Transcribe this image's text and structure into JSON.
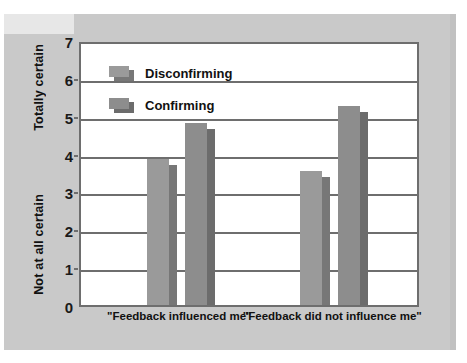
{
  "chart_data": {
    "type": "bar",
    "title": "",
    "xlabel": "",
    "ylabel": "",
    "ylim": [
      0,
      7
    ],
    "ytick_labels": [
      "0",
      "1",
      "2",
      "3",
      "4",
      "5",
      "6",
      "7"
    ],
    "ytick_values": [
      0,
      1,
      2,
      3,
      4,
      5,
      6,
      7
    ],
    "y_axis_top_annotation": "Totally certain",
    "y_axis_bottom_annotation": "Not at all certain",
    "grid": true,
    "legend_position": "top-left-inside",
    "categories": [
      "\"Feedback influenced me\"",
      "\"Feedback did not influence me\""
    ],
    "series": [
      {
        "name": "Disconfirming",
        "values": [
          3.85,
          3.55
        ],
        "color": "#9a9a9a"
      },
      {
        "name": "Confirming",
        "values": [
          4.8,
          5.25
        ],
        "color": "#8d8d8d"
      }
    ]
  },
  "axis": {
    "y_ticks": [
      {
        "label": "7",
        "value": 7
      },
      {
        "label": "6",
        "value": 6
      },
      {
        "label": "5",
        "value": 5
      },
      {
        "label": "4",
        "value": 4
      },
      {
        "label": "3",
        "value": 3
      },
      {
        "label": "2",
        "value": 2
      },
      {
        "label": "1",
        "value": 1
      },
      {
        "label": "0",
        "value": 0
      }
    ],
    "y_title_top": "Totally certain",
    "y_title_bottom": "Not at all certain",
    "x_labels": [
      "\"Feedback influenced me\"",
      "\"Feedback did not influence me\""
    ]
  },
  "legend": {
    "entries": [
      {
        "label": "Disconfirming",
        "swatch": "light-grey-3d-bar-icon"
      },
      {
        "label": "Confirming",
        "swatch": "dark-grey-3d-bar-icon"
      }
    ]
  },
  "colors": {
    "panel_background": "#c9c9c9",
    "plot_background": "#ffffff",
    "axis_line": "#6e6e6e",
    "bar_light_face": "#9a9a9a",
    "bar_light_side": "#777777",
    "bar_dark_face": "#8d8d8d",
    "bar_dark_side": "#6c6c6c",
    "text": "#111111"
  }
}
